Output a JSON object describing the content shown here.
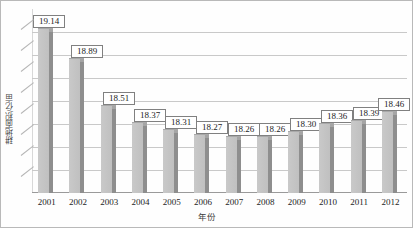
{
  "chart_data": {
    "type": "bar",
    "title": "",
    "xlabel": "年份",
    "ylabel": "耕地面积/亿亩",
    "categories": [
      "2001",
      "2002",
      "2003",
      "2004",
      "2005",
      "2006",
      "2007",
      "2008",
      "2009",
      "2010",
      "2011",
      "2012"
    ],
    "values": [
      19.14,
      18.89,
      18.51,
      18.37,
      18.31,
      18.27,
      18.26,
      18.26,
      18.3,
      18.36,
      18.39,
      18.46
    ],
    "labels": [
      "19.14",
      "18.89",
      "18.51",
      "18.37",
      "18.31",
      "18.27",
      "18.26",
      "18.26",
      "18.30",
      "18.36",
      "18.39",
      "18.46"
    ],
    "ylim": [
      17.8,
      19.3
    ],
    "grid": true,
    "gridline_count": 7,
    "legend": "none",
    "series": [
      {
        "name": "耕地面积",
        "values": [
          19.14,
          18.89,
          18.51,
          18.37,
          18.31,
          18.27,
          18.26,
          18.26,
          18.3,
          18.36,
          18.39,
          18.46
        ]
      }
    ],
    "colors": {
      "bar_face": "#c4c4c4",
      "bar_side": "#8e8e8e",
      "gridline": "#c9c9c9",
      "label_border": "#808080",
      "text": "#1d1d1d"
    }
  }
}
